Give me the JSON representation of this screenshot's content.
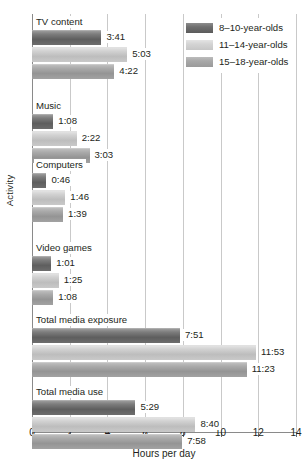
{
  "chart_data": {
    "type": "bar",
    "orientation": "horizontal",
    "title": "",
    "xlabel": "Hours per day",
    "ylabel": "Activity",
    "xlim": [
      0,
      14
    ],
    "xticks": [
      0,
      2,
      4,
      6,
      8,
      10,
      12,
      14
    ],
    "xtick_labels": [
      "0",
      "2",
      "4",
      "6",
      "8",
      "10",
      "12",
      "14"
    ],
    "grid": "vertical",
    "legend_position": "top-right",
    "categories": [
      "TV content",
      "Music",
      "Computers",
      "Video games",
      "Total media exposure",
      "Total media use"
    ],
    "series": [
      {
        "name": "8–10-year-olds",
        "color": "#6f6f6f",
        "values": [
          3.683,
          1.133,
          0.767,
          1.017,
          7.85,
          5.483
        ],
        "labels": [
          "3:41",
          "1:08",
          "0:46",
          "1:01",
          "7:51",
          "5:29"
        ]
      },
      {
        "name": "11–14-year-olds",
        "color": "#d4d4d4",
        "values": [
          5.05,
          2.367,
          1.767,
          1.417,
          11.883,
          8.667
        ],
        "labels": [
          "5:03",
          "2:22",
          "1:46",
          "1:25",
          "11:53",
          "8:40"
        ]
      },
      {
        "name": "15–18-year-olds",
        "color": "#a8a8a8",
        "values": [
          4.367,
          3.05,
          1.65,
          1.133,
          11.383,
          7.967
        ],
        "labels": [
          "4:22",
          "3:03",
          "1:39",
          "1:08",
          "11:23",
          "7:58"
        ]
      }
    ]
  },
  "legend": {
    "items": [
      {
        "label": "8–10-year-olds"
      },
      {
        "label": "11–14-year-olds"
      },
      {
        "label": "15–18-year-olds"
      }
    ]
  },
  "axes": {
    "x_title": "Hours per day",
    "y_title": "Activity"
  }
}
